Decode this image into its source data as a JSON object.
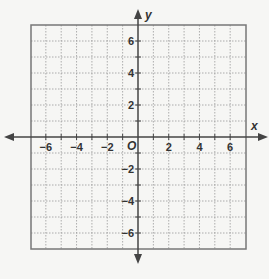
{
  "chart_data": {
    "type": "scatter",
    "title": "",
    "xlabel": "x",
    "ylabel": "y",
    "origin_label": "O",
    "xlim": [
      -7,
      7
    ],
    "ylim": [
      -7,
      7
    ],
    "grid": true,
    "grid_style": "dotted",
    "x_ticks": [
      -6,
      -4,
      -2,
      2,
      4,
      6
    ],
    "y_ticks": [
      -6,
      -4,
      -2,
      2,
      4,
      6
    ],
    "x_tick_labels": [
      "−6",
      "−4",
      "−2",
      "2",
      "4",
      "6"
    ],
    "y_tick_labels": [
      "−6",
      "−4",
      "−2",
      "2",
      "4",
      "6"
    ],
    "series": []
  },
  "colors": {
    "background": "#f6f6f4",
    "grid": "#9a9a9a",
    "border": "#777777",
    "axis": "#444444",
    "text": "#333333"
  }
}
